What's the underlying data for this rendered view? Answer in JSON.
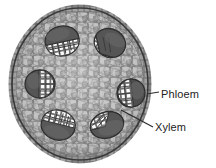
{
  "figure": {
    "background_color": "#ffffff"
  },
  "labels": [
    {
      "id": "phloem",
      "text": "Phloem",
      "color": "#232323",
      "leader_from": [
        147,
        94
      ],
      "leader_to": [
        160,
        93
      ]
    },
    {
      "id": "xylem",
      "text": "Xylem",
      "color": "#232323",
      "leader_from": [
        121,
        110
      ],
      "leader_to": [
        154,
        127
      ]
    }
  ],
  "stem": {
    "name": "stem-cross-section",
    "shape": "ellipse",
    "center": [
      80,
      84
    ],
    "radius_x": 68,
    "radius_y": 76,
    "ground_tissue_color": "#a8a8a8",
    "cell_wall_color": "#5e5e5e",
    "outline_color": "#3d3d3d",
    "epidermis_color": "#8f8f8f"
  },
  "bundles": [
    {
      "name": "vascular-bundle-top-left",
      "center": [
        62,
        40
      ],
      "rx": 17,
      "ry": 14,
      "rotation": -12,
      "sclerenchyma_color": "#4c4c4c",
      "phloem_color": "#f2f2f2",
      "phloem_side": "bottom"
    },
    {
      "name": "vascular-bundle-top-right",
      "center": [
        110,
        43
      ],
      "rx": 16,
      "ry": 14,
      "rotation": 28,
      "sclerenchyma_color": "#4c4c4c",
      "phloem_color": "#f2f2f2",
      "phloem_side": "bottom-left"
    },
    {
      "name": "vascular-bundle-left",
      "center": [
        40,
        84
      ],
      "rx": 15,
      "ry": 14,
      "rotation": 0,
      "sclerenchyma_color": "#4c4c4c",
      "phloem_color": "#f2f2f2",
      "phloem_side": "right"
    },
    {
      "name": "vascular-bundle-right",
      "center": [
        131,
        93
      ],
      "rx": 14,
      "ry": 14,
      "rotation": 0,
      "sclerenchyma_color": "#4c4c4c",
      "phloem_color": "#f2f2f2",
      "phloem_side": "left"
    },
    {
      "name": "vascular-bundle-bottom-left",
      "center": [
        58,
        126
      ],
      "rx": 17,
      "ry": 14,
      "rotation": 14,
      "sclerenchyma_color": "#4c4c4c",
      "phloem_color": "#f2f2f2",
      "phloem_side": "top"
    },
    {
      "name": "vascular-bundle-bottom-right",
      "center": [
        107,
        125
      ],
      "rx": 17,
      "ry": 13,
      "rotation": -18,
      "sclerenchyma_color": "#4c4c4c",
      "phloem_color": "#f2f2f2",
      "phloem_side": "top-left"
    }
  ]
}
